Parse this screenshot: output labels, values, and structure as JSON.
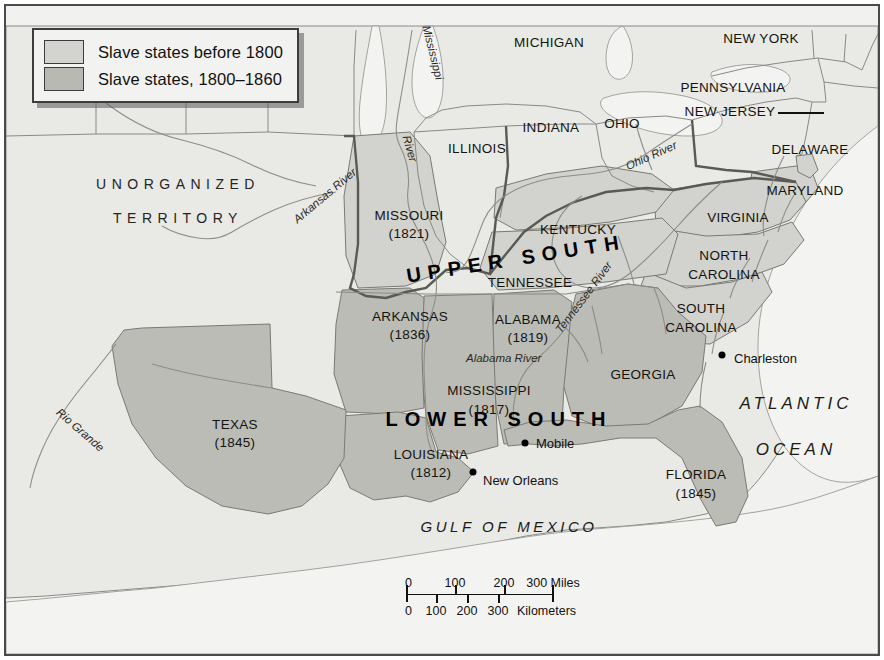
{
  "map": {
    "title": "Slave states of the United States before 1860",
    "colors": {
      "land": "#e7e7e4",
      "water": "#f4f4f2",
      "slave_before_1800": "#cfcfcb",
      "slave_1800_1860": "#b9b9b3",
      "border": "#7a7a74",
      "heavy_border": "#5d5d57",
      "frame": "#4a4a4a",
      "text": "#111111"
    }
  },
  "legend": {
    "items": [
      {
        "label": "Slave states before 1800",
        "swatch": "#d3d3cf"
      },
      {
        "label": "Slave states, 1800–1860",
        "swatch": "#b9b9b3"
      }
    ]
  },
  "regions": [
    {
      "name": "UPPER SOUTH",
      "id": "upper-south"
    },
    {
      "name": "LOWER SOUTH",
      "id": "lower-south"
    }
  ],
  "territory": {
    "line1": "UNORGANIZED",
    "line2": "TERRITORY"
  },
  "oceans": [
    {
      "line1": "ATLANTIC",
      "line2": "OCEAN"
    },
    {
      "name": "GULF OF MEXICO"
    }
  ],
  "states": [
    {
      "name": "MICHIGAN",
      "year": ""
    },
    {
      "name": "NEW YORK",
      "year": ""
    },
    {
      "name": "PENNSYLVANIA",
      "year": ""
    },
    {
      "name": "NEW JERSEY",
      "year": ""
    },
    {
      "name": "DELAWARE",
      "year": ""
    },
    {
      "name": "MARYLAND",
      "year": ""
    },
    {
      "name": "OHIO",
      "year": ""
    },
    {
      "name": "INDIANA",
      "year": ""
    },
    {
      "name": "ILLINOIS",
      "year": ""
    },
    {
      "name": "MISSOURI",
      "year": "(1821)"
    },
    {
      "name": "KENTUCKY",
      "year": ""
    },
    {
      "name": "VIRGINIA",
      "year": ""
    },
    {
      "name": "NORTH CAROLINA",
      "year": ""
    },
    {
      "name": "SOUTH CAROLINA",
      "year": ""
    },
    {
      "name": "TENNESSEE",
      "year": ""
    },
    {
      "name": "ARKANSAS",
      "year": "(1836)"
    },
    {
      "name": "ALABAMA",
      "year": "(1819)"
    },
    {
      "name": "GEORGIA",
      "year": ""
    },
    {
      "name": "MISSISSIPPI",
      "year": "(1817)"
    },
    {
      "name": "LOUISIANA",
      "year": "(1812)"
    },
    {
      "name": "TEXAS",
      "year": "(1845)"
    },
    {
      "name": "FLORIDA",
      "year": "(1845)"
    }
  ],
  "state_labels": {
    "michigan": "MICHIGAN",
    "new_york": "NEW YORK",
    "pennsylvania": "PENNSYLVANIA",
    "new_jersey": "NEW JERSEY",
    "delaware": "DELAWARE",
    "maryland": "MARYLAND",
    "ohio": "OHIO",
    "indiana": "INDIANA",
    "illinois": "ILLINOIS",
    "missouri": "MISSOURI",
    "missouri_year": "(1821)",
    "kentucky": "KENTUCKY",
    "virginia": "VIRGINIA",
    "north_carolina_1": "NORTH",
    "north_carolina_2": "CAROLINA",
    "south_carolina_1": "SOUTH",
    "south_carolina_2": "CAROLINA",
    "tennessee": "TENNESSEE",
    "arkansas": "ARKANSAS",
    "arkansas_year": "(1836)",
    "alabama": "ALABAMA",
    "alabama_year": "(1819)",
    "georgia": "GEORGIA",
    "mississippi": "MISSISSIPPI",
    "mississippi_year": "(1817)",
    "louisiana": "LOUISIANA",
    "louisiana_year": "(1812)",
    "texas": "TEXAS",
    "texas_year": "(1845)",
    "florida": "FLORIDA",
    "florida_year": "(1845)"
  },
  "rivers": [
    {
      "name": "Mississippi",
      "id": "mississippi-river-top"
    },
    {
      "name": "River",
      "id": "mississippi-river-bottom"
    },
    {
      "name": "Ohio River",
      "id": "ohio-river"
    },
    {
      "name": "Tennessee River",
      "id": "tennessee-river"
    },
    {
      "name": "Alabama River",
      "id": "alabama-river"
    },
    {
      "name": "Arkansas River",
      "id": "arkansas-river"
    },
    {
      "name": "Rio Grande",
      "id": "rio-grande"
    }
  ],
  "river_labels": {
    "mississippi_a": "Mississippi",
    "mississippi_b": "River",
    "ohio": "Ohio River",
    "tennessee": "Tennessee River",
    "alabama": "Alabama River",
    "arkansas": "Arkansas River",
    "rio_grande": "Rio Grande"
  },
  "cities": [
    {
      "name": "Charleston"
    },
    {
      "name": "Mobile"
    },
    {
      "name": "New Orleans"
    }
  ],
  "city_labels": {
    "charleston": "Charleston",
    "mobile": "Mobile",
    "new_orleans": "New Orleans"
  },
  "scale": {
    "miles": {
      "ticks": [
        "0",
        "100",
        "200",
        "300"
      ],
      "unit": "Miles",
      "label": "300 Miles"
    },
    "kilometers": {
      "ticks": [
        "0",
        "100",
        "200",
        "300"
      ],
      "unit": "Kilometers",
      "label": "300 Kilometers"
    },
    "miles_0": "0",
    "miles_100": "100",
    "miles_200": "200",
    "miles_300": "300 Miles",
    "km_0": "0",
    "km_100": "100",
    "km_200": "200",
    "km_300": "300",
    "km_unit": "Kilometers"
  }
}
